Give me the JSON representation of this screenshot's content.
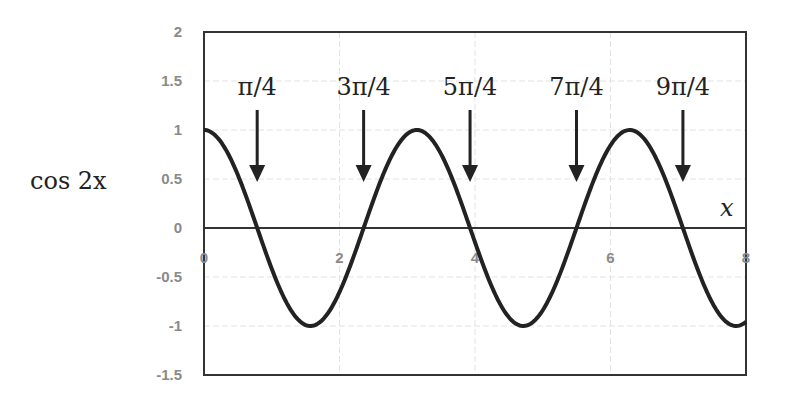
{
  "chart_data": {
    "type": "line",
    "title": "",
    "xlabel": "x",
    "ylabel": "cos 2x",
    "xlim": [
      0,
      8
    ],
    "ylim": [
      -1.5,
      2
    ],
    "x_ticks": [
      "0",
      "2",
      "4",
      "6",
      "8"
    ],
    "y_ticks": [
      "2",
      "1.5",
      "1",
      "0.5",
      "0",
      "-0.5",
      "-1",
      "-1.5"
    ],
    "grid": true,
    "legend": "none",
    "series": [
      {
        "name": "cos 2x",
        "function": "cos(2x)",
        "x_range": [
          0,
          8
        ],
        "color": "#222222"
      }
    ],
    "annotations": [
      {
        "label": "π/4",
        "x": 0.785
      },
      {
        "label": "3π/4",
        "x": 2.356
      },
      {
        "label": "5π/4",
        "x": 3.927
      },
      {
        "label": "7π/4",
        "x": 5.498
      },
      {
        "label": "9π/4",
        "x": 7.069
      }
    ]
  }
}
